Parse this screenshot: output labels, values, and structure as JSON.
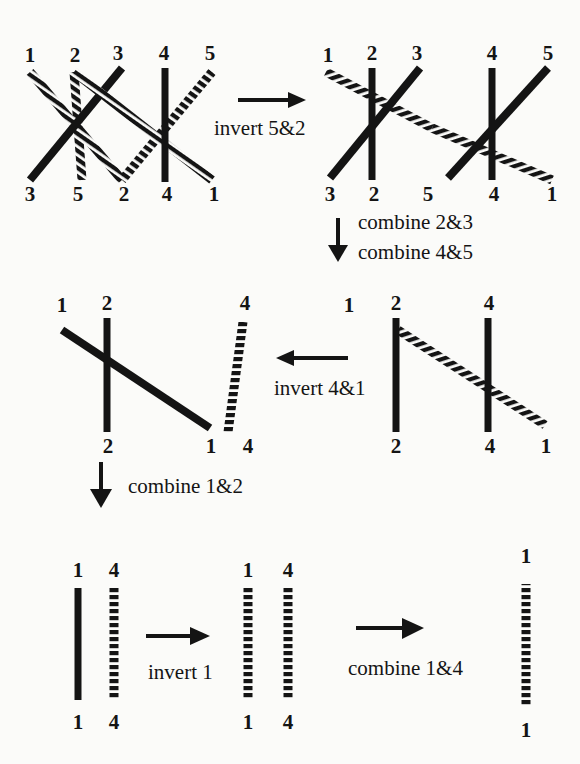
{
  "figure": {
    "background_color": "#fbfbf9",
    "ink_color": "#141414"
  },
  "operations": {
    "invert_5_2": "invert 5&2",
    "combine_2_3": "combine 2&3",
    "combine_4_5": "combine 4&5",
    "invert_4_1": "invert 4&1",
    "combine_1_2": "combine 1&2",
    "invert_1": "invert 1",
    "combine_1_4": "combine 1&4"
  },
  "panels": [
    {
      "id": "r1-left",
      "top_labels": [
        "1",
        "2",
        "3",
        "4",
        "5"
      ],
      "bottom_labels": [
        "3",
        "5",
        "2",
        "4",
        "1"
      ]
    },
    {
      "id": "r1-right",
      "top_labels": [
        "1",
        "2",
        "3",
        "4",
        "5"
      ],
      "bottom_labels": [
        "3",
        "2",
        "5",
        "4",
        "1"
      ]
    },
    {
      "id": "r2-right",
      "top_labels": [
        "1",
        "2",
        "4"
      ],
      "bottom_labels": [
        "2",
        "4",
        "1"
      ]
    },
    {
      "id": "r2-left",
      "top_labels": [
        "1",
        "2",
        "4"
      ],
      "bottom_labels": [
        "2",
        "1",
        "4"
      ]
    },
    {
      "id": "r3-left",
      "top_labels": [
        "1",
        "4"
      ],
      "bottom_labels": [
        "1",
        "4"
      ]
    },
    {
      "id": "r3-mid",
      "top_labels": [
        "1",
        "4"
      ],
      "bottom_labels": [
        "1",
        "4"
      ]
    },
    {
      "id": "r3-right",
      "top_labels": [
        "1"
      ],
      "bottom_labels": [
        "1"
      ]
    }
  ],
  "labels": {
    "r1l_t1": "1",
    "r1l_t2": "2",
    "r1l_t3": "3",
    "r1l_t4": "4",
    "r1l_t5": "5",
    "r1l_b1": "3",
    "r1l_b2": "5",
    "r1l_b3": "2",
    "r1l_b4": "4",
    "r1l_b5": "1",
    "r1r_t1": "1",
    "r1r_t2": "2",
    "r1r_t3": "3",
    "r1r_t4": "4",
    "r1r_t5": "5",
    "r1r_b1": "3",
    "r1r_b2": "2",
    "r1r_b3": "5",
    "r1r_b4": "4",
    "r1r_b5": "1",
    "r2r_t1": "1",
    "r2r_t2": "2",
    "r2r_t3": "4",
    "r2r_b1": "2",
    "r2r_b2": "4",
    "r2r_b3": "1",
    "r2l_t1": "1",
    "r2l_t2": "2",
    "r2l_t3": "4",
    "r2l_b1": "2",
    "r2l_b2": "1",
    "r2l_b3": "4",
    "r3l_t1": "1",
    "r3l_t2": "4",
    "r3l_b1": "1",
    "r3l_b2": "4",
    "r3m_t1": "1",
    "r3m_t2": "4",
    "r3m_b1": "1",
    "r3m_b2": "4",
    "r3r_t1": "1",
    "r3r_b1": "1"
  }
}
